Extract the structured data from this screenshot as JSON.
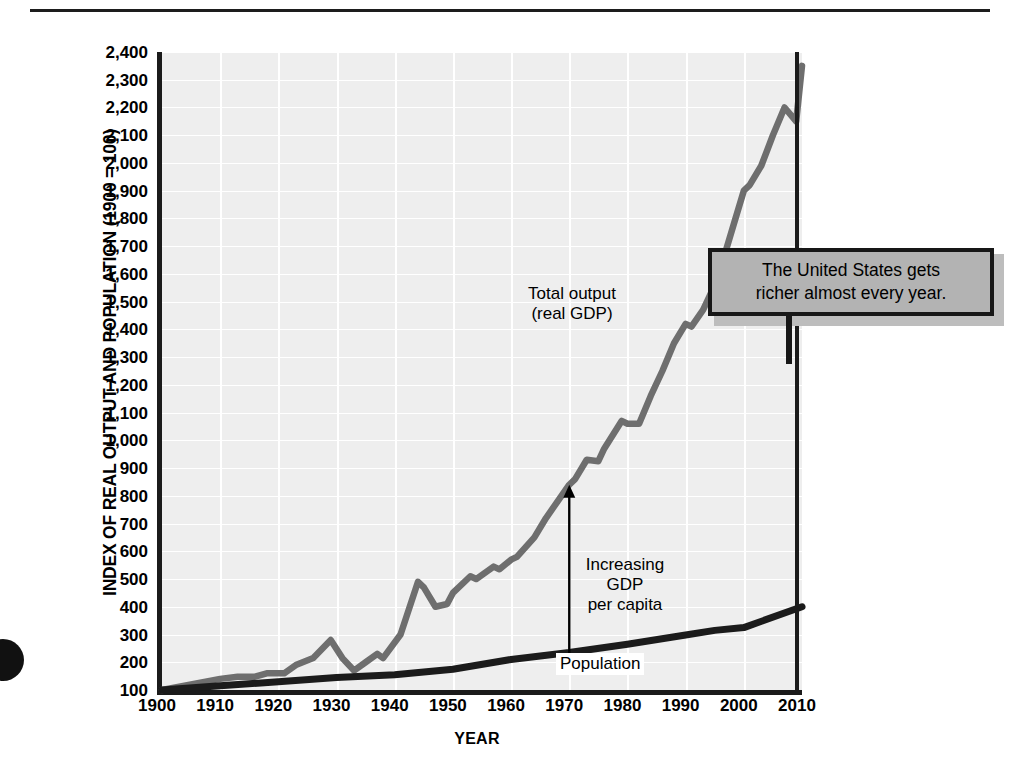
{
  "figure": {
    "y_axis_title": "INDEX OF REAL OUTPUT AND POPULATION (1900 = 100)",
    "x_axis_title": "YEAR",
    "callout_text": "The United States gets\nricher almost every year.",
    "annotations": {
      "total_output": "Total output\n(real GDP)",
      "increasing_gdp": "Increasing\nGDP\nper capita",
      "population": "Population"
    },
    "colors": {
      "plot_background": "#eeeeee",
      "gridline": "#ffffff",
      "axis": "#1b1b1b",
      "gdp_line": "#6e6e6e",
      "population_line": "#1b1b1b",
      "callout_fill": "#b3b3b3",
      "callout_border": "#171717"
    }
  },
  "chart_data": {
    "type": "line",
    "title": "",
    "xlabel": "YEAR",
    "ylabel": "INDEX OF REAL OUTPUT AND POPULATION (1900 = 100)",
    "xlim": [
      1900,
      2010
    ],
    "ylim": [
      100,
      2400
    ],
    "grid": true,
    "legend": "inline-labels",
    "xticks": [
      1900,
      1910,
      1920,
      1930,
      1940,
      1950,
      1960,
      1970,
      1980,
      1990,
      2000,
      2010
    ],
    "yticks": [
      100,
      200,
      300,
      400,
      500,
      600,
      700,
      800,
      900,
      1000,
      1100,
      1200,
      1300,
      1400,
      1500,
      1600,
      1700,
      1800,
      1900,
      2000,
      2100,
      2200,
      2300,
      2400
    ],
    "ytick_labels": [
      "100",
      "200",
      "300",
      "400",
      "500",
      "600",
      "700",
      "800",
      "900",
      "1,000",
      "1,100",
      "1,200",
      "1,300",
      "1,400",
      "1,500",
      "1,600",
      "1,700",
      "1,800",
      "1,900",
      "2,000",
      "2,100",
      "2,200",
      "2,300",
      "2,400"
    ],
    "annotations": [
      {
        "text": "Total output\n(real GDP)",
        "x": 1962,
        "y": 1360
      },
      {
        "text": "Increasing\nGDP\nper capita",
        "x": 1974,
        "y": 590
      },
      {
        "text": "Population",
        "x": 1973,
        "y": 205
      },
      {
        "text": "The United States gets\nricher almost every year.",
        "x": 2004,
        "y": 1660
      }
    ],
    "arrow": {
      "label": "Increasing GDP per capita",
      "x": 1970,
      "y_from": 180,
      "y_to": 840,
      "double_headed": true
    },
    "series": [
      {
        "name": "Total output (real GDP)",
        "color": "#6e6e6e",
        "x": [
          1900,
          1905,
          1910,
          1913,
          1916,
          1918,
          1921,
          1923,
          1926,
          1929,
          1931,
          1933,
          1935,
          1937,
          1938,
          1941,
          1944,
          1945,
          1947,
          1949,
          1950,
          1953,
          1954,
          1957,
          1958,
          1960,
          1961,
          1964,
          1966,
          1968,
          1970,
          1971,
          1973,
          1975,
          1976,
          1979,
          1980,
          1982,
          1984,
          1986,
          1988,
          1990,
          1991,
          1993,
          1995,
          1996,
          1998,
          2000,
          2001,
          2003,
          2005,
          2007,
          2009,
          2010
        ],
        "y": [
          100,
          120,
          140,
          148,
          148,
          160,
          160,
          190,
          215,
          280,
          215,
          170,
          200,
          230,
          215,
          300,
          490,
          470,
          400,
          410,
          450,
          510,
          500,
          545,
          535,
          570,
          580,
          650,
          720,
          780,
          840,
          860,
          930,
          925,
          970,
          1070,
          1060,
          1060,
          1160,
          1250,
          1350,
          1420,
          1410,
          1470,
          1560,
          1620,
          1760,
          1900,
          1920,
          1990,
          2100,
          2200,
          2150,
          2350
        ]
      },
      {
        "name": "Population",
        "color": "#1b1b1b",
        "x": [
          1900,
          1910,
          1920,
          1930,
          1940,
          1950,
          1960,
          1970,
          1980,
          1990,
          1995,
          2000,
          2010
        ],
        "y": [
          100,
          115,
          130,
          145,
          155,
          175,
          210,
          235,
          265,
          298,
          315,
          325,
          400
        ]
      }
    ]
  }
}
